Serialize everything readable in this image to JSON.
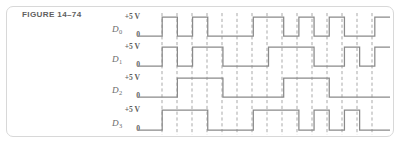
{
  "figure": {
    "caption": "FIGURE 14–74",
    "frame_color": "#d8d8d8",
    "background": "#ffffff"
  },
  "style": {
    "trace_color": "#8a8a8a",
    "dash_color": "#9a9a9a",
    "text_color": "#5f5f5f"
  },
  "axis": {
    "high_label": "+5 V",
    "low_label": "0"
  },
  "channels": [
    {
      "name": "D",
      "subscript": "0",
      "high_label": "+5 V",
      "low_label": "0"
    },
    {
      "name": "D",
      "subscript": "1",
      "high_label": "+5 V",
      "low_label": "0"
    },
    {
      "name": "D",
      "subscript": "2",
      "high_label": "+5 V",
      "low_label": "0"
    },
    {
      "name": "D",
      "subscript": "3",
      "high_label": "+5 V",
      "low_label": "0"
    }
  ],
  "chart_data": {
    "type": "line",
    "title": "FIGURE 14–74",
    "xlabel": "",
    "ylabel": "",
    "subtype": "digital-timing-diagram",
    "voltage_high": 5,
    "voltage_low": 0,
    "units": "V",
    "bit_count": 4,
    "interval_count": 16,
    "x_start_px": 147,
    "x_end_px": 390,
    "grid": "dashed-vertical-timing-marks",
    "legend": "none",
    "series": [
      {
        "name": "D0",
        "label": "D₀",
        "baseline_px": 36,
        "top_px": 17,
        "values": [
          0,
          1,
          0,
          1,
          0,
          0,
          0,
          1,
          1,
          0,
          1,
          0,
          1,
          0,
          0,
          1
        ]
      },
      {
        "name": "D1",
        "label": "D₁",
        "baseline_px": 66,
        "top_px": 47,
        "values": [
          0,
          1,
          0,
          1,
          1,
          0,
          0,
          0,
          1,
          1,
          1,
          0,
          0,
          1,
          0,
          1
        ]
      },
      {
        "name": "D2",
        "label": "D₂",
        "baseline_px": 97,
        "top_px": 78,
        "values": [
          0,
          0,
          1,
          1,
          1,
          0,
          0,
          0,
          0,
          1,
          1,
          1,
          0,
          0,
          0,
          0
        ]
      },
      {
        "name": "D3",
        "label": "D₃",
        "baseline_px": 130,
        "top_px": 110,
        "values": [
          0,
          1,
          1,
          1,
          0,
          0,
          0,
          1,
          1,
          1,
          0,
          1,
          0,
          1,
          0,
          0
        ]
      }
    ],
    "dashed_marker_positions_px": [
      162,
      177,
      192,
      207,
      222,
      237,
      252,
      267,
      282,
      297,
      312,
      327,
      342,
      357,
      372
    ]
  }
}
